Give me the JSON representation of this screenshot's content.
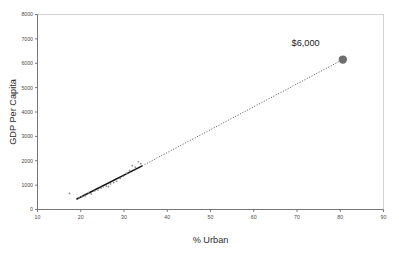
{
  "chart_data": {
    "type": "scatter",
    "title": "",
    "xlabel": "% Urban",
    "ylabel": "GDP Per Capita",
    "xlim": [
      10,
      90
    ],
    "ylim": [
      0,
      8000
    ],
    "xticks": [
      10,
      20,
      30,
      40,
      50,
      60,
      70,
      80,
      90
    ],
    "xtick_labels": [
      "10",
      "20",
      "30",
      "40",
      "50",
      "60",
      "70",
      "80",
      "90"
    ],
    "yticks": [
      0,
      1000,
      2000,
      3000,
      4000,
      5000,
      6000,
      7000,
      8000
    ],
    "ytick_labels": [
      "0",
      "1000",
      "2000",
      "3000",
      "4000",
      "5000",
      "6000",
      "7000",
      "8000"
    ],
    "grid": false,
    "legend": "none",
    "series": [
      {
        "name": "observed",
        "marker": "small-dot",
        "color": "#8a8a8a",
        "points": [
          {
            "x": 17.4,
            "y": 660
          },
          {
            "x": 19.6,
            "y": 480
          },
          {
            "x": 20.3,
            "y": 520
          },
          {
            "x": 21.0,
            "y": 560
          },
          {
            "x": 21.8,
            "y": 690
          },
          {
            "x": 22.4,
            "y": 640
          },
          {
            "x": 23.2,
            "y": 760
          },
          {
            "x": 24.0,
            "y": 800
          },
          {
            "x": 24.7,
            "y": 880
          },
          {
            "x": 25.2,
            "y": 930
          },
          {
            "x": 25.9,
            "y": 960
          },
          {
            "x": 26.4,
            "y": 940
          },
          {
            "x": 26.9,
            "y": 1050
          },
          {
            "x": 27.6,
            "y": 1100
          },
          {
            "x": 28.3,
            "y": 1160
          },
          {
            "x": 29.1,
            "y": 1280
          },
          {
            "x": 29.8,
            "y": 1360
          },
          {
            "x": 30.6,
            "y": 1480
          },
          {
            "x": 31.3,
            "y": 1600
          },
          {
            "x": 31.9,
            "y": 1800
          },
          {
            "x": 32.6,
            "y": 1740
          },
          {
            "x": 33.3,
            "y": 1960
          },
          {
            "x": 33.9,
            "y": 1880
          }
        ]
      },
      {
        "name": "projected",
        "marker": "large-dot",
        "color": "#6e6e6e",
        "points": [
          {
            "x": 80.6,
            "y": 6150
          }
        ]
      }
    ],
    "fit_line": {
      "name": "regression-fit",
      "style": "solid",
      "color": "#111111",
      "x_start": 19.0,
      "y_start": 420,
      "x_end": 34.2,
      "y_end": 1790
    },
    "extrapolation_line": {
      "name": "extrapolation",
      "style": "dotted",
      "color": "#555555",
      "x_start": 34.2,
      "y_start": 1790,
      "x_end": 80.6,
      "y_end": 6150
    },
    "annotations": [
      {
        "text": "$6,000",
        "x": 72.0,
        "y": 6700,
        "target_x": 80.6,
        "target_y": 6150
      }
    ]
  },
  "frame": {
    "border_color": "#c9c9c9",
    "axis_color": "#6b6b6b",
    "background": "#ffffff"
  }
}
